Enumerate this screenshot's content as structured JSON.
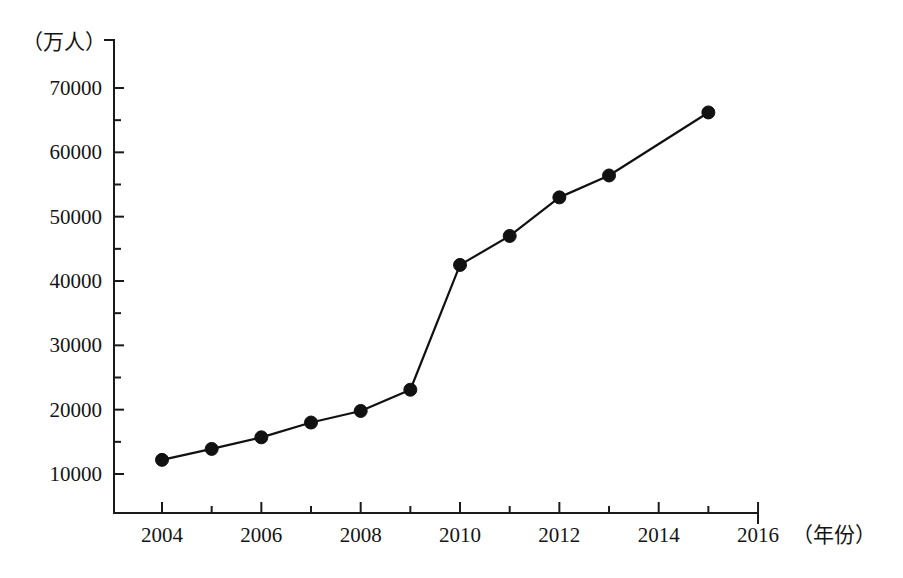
{
  "chart_data": {
    "type": "line",
    "title": "",
    "subtitle": "",
    "xlabel": "（年份）",
    "ylabel": "（万人）",
    "x": [
      2004,
      2005,
      2006,
      2007,
      2008,
      2009,
      2010,
      2011,
      2012,
      2013,
      2015
    ],
    "values": [
      12200,
      13900,
      15700,
      18000,
      19800,
      23100,
      42500,
      47000,
      53000,
      56400,
      66200
    ],
    "series": [
      {
        "name": "",
        "values": [
          12200,
          13900,
          15700,
          18000,
          19800,
          23100,
          42500,
          47000,
          53000,
          56400,
          66200
        ]
      }
    ],
    "xlim": [
      2003,
      2016
    ],
    "ylim": [
      5000,
      72000
    ],
    "xticks": [
      2004,
      2006,
      2008,
      2010,
      2012,
      2014,
      2016
    ],
    "xtick_labels": [
      "2004",
      "2006",
      "2008",
      "2010",
      "2012",
      "2014",
      "2016"
    ],
    "xticks_minor": [
      2005,
      2007,
      2009,
      2011,
      2013,
      2015
    ],
    "yticks": [
      10000,
      20000,
      30000,
      40000,
      50000,
      60000,
      70000
    ],
    "ytick_labels": [
      "10000",
      "20000",
      "30000",
      "40000",
      "50000",
      "60000",
      "70000"
    ],
    "yticks_minor": [
      15000,
      25000,
      35000,
      45000,
      55000,
      65000
    ],
    "grid": false,
    "legend": false,
    "legend_position": "none",
    "marker": "filled-circle",
    "line_color": "#111111",
    "marker_color": "#111111",
    "axis_color": "#1a1a1a",
    "background_color": "#ffffff"
  },
  "axis": {
    "y_unit_label": "（万人）",
    "x_unit_label": "（年份）"
  }
}
